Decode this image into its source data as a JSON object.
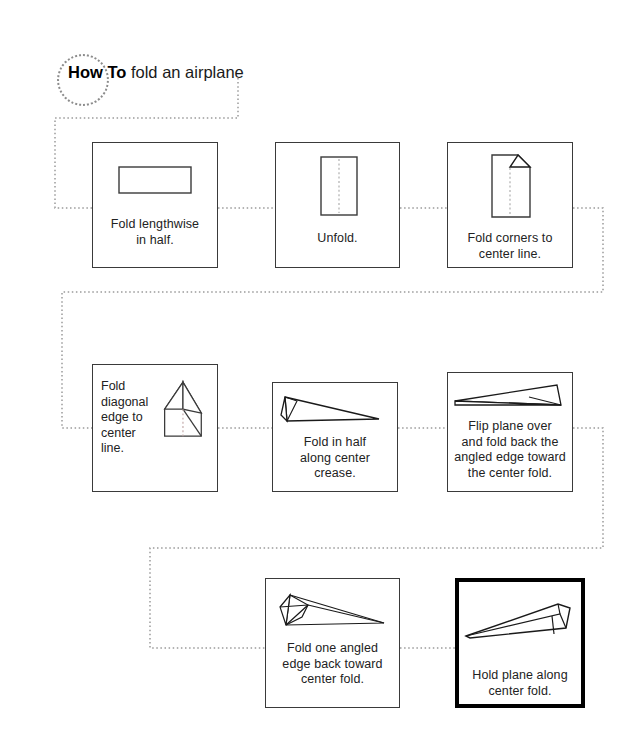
{
  "title": {
    "bold_prefix": "How To",
    "rest": " fold an airplane",
    "circle_icon": "dotted-circle"
  },
  "steps": [
    {
      "id": "step-1",
      "caption_lines": [
        "Fold lengthwise",
        "in half."
      ],
      "figure": "folded-strip-rectangle",
      "emphasis": false,
      "layout": "stacked"
    },
    {
      "id": "step-2",
      "caption_lines": [
        "Unfold."
      ],
      "figure": "upright-sheet-with-center-crease",
      "emphasis": false,
      "layout": "stacked"
    },
    {
      "id": "step-3",
      "caption_lines": [
        "Fold corners to",
        "center line."
      ],
      "figure": "sheet-with-folded-corner",
      "emphasis": false,
      "layout": "stacked"
    },
    {
      "id": "step-4",
      "caption_lines": [
        "Fold",
        "diagonal",
        "edge to",
        "center",
        "line."
      ],
      "figure": "sheet-with-diagonal-flaps",
      "emphasis": false,
      "layout": "side"
    },
    {
      "id": "step-5",
      "caption_lines": [
        "Fold in half",
        "along center",
        "crease."
      ],
      "figure": "plane-profile-narrow",
      "emphasis": false,
      "layout": "stacked"
    },
    {
      "id": "step-6",
      "caption_lines": [
        "Flip plane over",
        "and fold back the",
        "angled edge toward",
        "the center fold."
      ],
      "figure": "plane-profile-flipped",
      "emphasis": false,
      "layout": "stacked"
    },
    {
      "id": "step-7",
      "caption_lines": [
        "Fold one angled",
        "edge back toward",
        "center fold."
      ],
      "figure": "plane-with-wing-fold",
      "emphasis": false,
      "layout": "stacked"
    },
    {
      "id": "step-8",
      "caption_lines": [
        "Hold plane along",
        "center fold."
      ],
      "figure": "finished-plane",
      "emphasis": true,
      "layout": "stacked"
    }
  ],
  "colors": {
    "ink": "#1a1a1a",
    "box_border": "#3a3a3a",
    "emphasis_border": "#000000",
    "connector": "#9a9a9a",
    "crease": "#b5b5b5",
    "background": "#ffffff"
  },
  "connector_style": "dotted-line"
}
